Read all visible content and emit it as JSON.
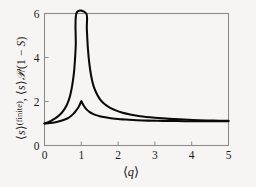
{
  "figure": {
    "background_color": "#f6f5f3",
    "frame_color": "#8d8d8d",
    "curve_color": "#0a0a0a",
    "x_axis_label_parts": {
      "open_bracket": "⟨",
      "symbol": "q",
      "close_bracket": "⟩"
    },
    "y_axis_label_parts": {
      "first_open": "⟨",
      "first_symbol": "s",
      "first_close": "⟩",
      "first_superscript": "(finite)",
      "separator": ", ",
      "second_open": "⟨",
      "second_symbol": "s",
      "second_close": "⟩",
      "script_p": "𝒫",
      "divider": "/(1 − ",
      "capital_s": "S",
      "tail": ")"
    }
  },
  "chart_data": {
    "type": "line",
    "title": "",
    "subtitle": "",
    "xlabel": "⟨q⟩",
    "ylabel": "⟨s⟩^(finite), ⟨s⟩𝒫/(1 − S)",
    "xlim": [
      0,
      5
    ],
    "ylim": [
      0,
      6
    ],
    "xticks": [
      0,
      1,
      2,
      3,
      4,
      5
    ],
    "xticklabels": [
      "0",
      "1",
      "2",
      "3",
      "4",
      "5"
    ],
    "yticks": [
      0,
      2,
      4,
      6
    ],
    "yticklabels": [
      "0",
      "2",
      "4",
      "6"
    ],
    "grid": false,
    "legend": "none",
    "annotations": [
      "Both curves begin at y = 1 at ⟨q⟩ = 0",
      "Divergence (vertical asymptote) at ⟨q⟩ = 1",
      "Cusp curve peaks at y = 2 exactly at ⟨q⟩ = 1",
      "Both curves decay asymptotically to y = 1 as ⟨q⟩ → 5"
    ],
    "series": [
      {
        "name": "⟨s⟩𝒫/(1 − S)",
        "description": "divergent mean cluster size; vertical asymptote at q = 1",
        "x": [
          0.0,
          0.1,
          0.2,
          0.3,
          0.4,
          0.5,
          0.6,
          0.65,
          0.7,
          0.75,
          0.8,
          0.83,
          0.85,
          0.865,
          1.135,
          1.15,
          1.18,
          1.22,
          1.27,
          1.33,
          1.4,
          1.5,
          1.6,
          1.75,
          1.9,
          2.1,
          2.3,
          2.6,
          3.0,
          3.4,
          3.8,
          4.2,
          4.6,
          5.0
        ],
        "y": [
          1.0,
          1.06,
          1.14,
          1.24,
          1.37,
          1.55,
          1.82,
          2.02,
          2.3,
          2.7,
          3.3,
          3.95,
          4.6,
          6.0,
          6.0,
          5.3,
          4.4,
          3.7,
          3.15,
          2.72,
          2.42,
          2.12,
          1.93,
          1.74,
          1.62,
          1.5,
          1.42,
          1.33,
          1.26,
          1.21,
          1.18,
          1.15,
          1.13,
          1.12
        ]
      },
      {
        "name": "⟨s⟩^(finite)",
        "description": "finite-cluster mean size; sharp cusp peak of 2 at q = 1",
        "x": [
          0.0,
          0.15,
          0.3,
          0.45,
          0.55,
          0.65,
          0.72,
          0.79,
          0.85,
          0.9,
          0.94,
          0.97,
          1.0,
          1.03,
          1.06,
          1.1,
          1.15,
          1.22,
          1.3,
          1.4,
          1.5,
          1.65,
          1.8,
          2.0,
          2.2,
          2.5,
          2.8,
          3.2,
          3.6,
          4.0,
          4.4,
          4.7,
          5.0
        ],
        "y": [
          1.0,
          1.02,
          1.06,
          1.12,
          1.18,
          1.26,
          1.34,
          1.45,
          1.57,
          1.68,
          1.79,
          1.9,
          2.02,
          1.92,
          1.83,
          1.73,
          1.63,
          1.53,
          1.45,
          1.38,
          1.33,
          1.28,
          1.24,
          1.2,
          1.18,
          1.15,
          1.13,
          1.12,
          1.11,
          1.1,
          1.1,
          1.1,
          1.1
        ]
      }
    ]
  }
}
